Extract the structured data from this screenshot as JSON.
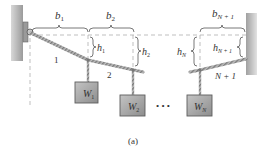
{
  "diagram": {
    "caption": "(a)",
    "spans": [
      {
        "id": "b1",
        "label": "b",
        "sub": "1"
      },
      {
        "id": "b2",
        "label": "b",
        "sub": "2"
      },
      {
        "id": "bN1",
        "label": "b",
        "sub": "N + 1"
      }
    ],
    "sags": [
      {
        "id": "h1",
        "label": "h",
        "sub": "1"
      },
      {
        "id": "h2",
        "label": "h",
        "sub": "2"
      },
      {
        "id": "hN",
        "label": "h",
        "sub": "N"
      },
      {
        "id": "hN1",
        "label": "h",
        "sub": "N + 1"
      }
    ],
    "segments": [
      {
        "id": "seg1",
        "label": "1"
      },
      {
        "id": "seg2",
        "label": "2"
      },
      {
        "id": "segN1",
        "label": "N + 1"
      }
    ],
    "weights": [
      {
        "id": "W1",
        "label": "W",
        "sub": "1"
      },
      {
        "id": "W2",
        "label": "W",
        "sub": "2"
      },
      {
        "id": "WN",
        "label": "W",
        "sub": "N"
      }
    ],
    "ellipsis": "• • •",
    "colors": {
      "wall": "#b5b5b5",
      "wall_shadow": "#8f8f8f",
      "rope": "#9a9a9a",
      "weight_fill": "#a9a9a9",
      "weight_edge": "#5e5e5e",
      "dash": "#9a9a9a",
      "text": "#333333"
    }
  }
}
